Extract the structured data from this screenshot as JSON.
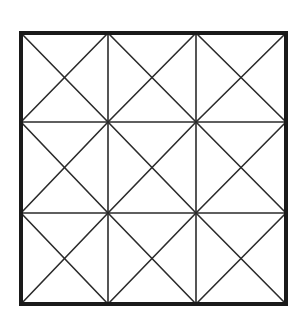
{
  "diagram": {
    "type": "grid-with-diagonals",
    "rows": 3,
    "cols": 3,
    "outer_box": {
      "x1": 21,
      "y1": 33,
      "x2": 286,
      "y2": 304
    },
    "vertical_lines_x": [
      21,
      108,
      196,
      286
    ],
    "horizontal_lines_y": [
      33,
      122,
      213,
      304
    ],
    "diagonals_per_cell": 2,
    "colors": {
      "background": "#ffffff",
      "outer_border": "#1a1a1a",
      "inner_lines": "#2b2b2b"
    },
    "stroke_widths": {
      "outer": 4,
      "inner": 1.6
    }
  }
}
